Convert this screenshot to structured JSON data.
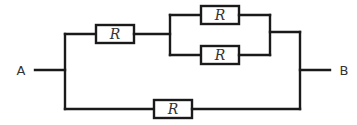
{
  "diagram": {
    "type": "circuit",
    "terminals": [
      {
        "id": "A",
        "label": "A"
      },
      {
        "id": "B",
        "label": "B"
      }
    ],
    "resistors": [
      {
        "id": "r1",
        "label": "R",
        "branch": "upper-series"
      },
      {
        "id": "r2",
        "label": "R",
        "branch": "upper-parallel-top"
      },
      {
        "id": "r3",
        "label": "R",
        "branch": "upper-parallel-bottom"
      },
      {
        "id": "r4",
        "label": "R",
        "branch": "lower"
      }
    ],
    "topology": "A - [ (R1 in series with (R2 || R3)) || R4 ] - B",
    "colors": {
      "line": "#1a1a1a",
      "text": "#333333",
      "background": "#ffffff"
    }
  }
}
